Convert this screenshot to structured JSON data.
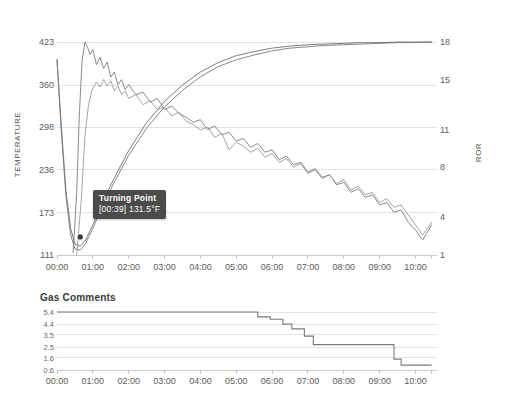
{
  "chart_data": [
    {
      "type": "line",
      "title": "",
      "xlabel": "",
      "ylabel": "TEMPERATURE",
      "y2label": "ROR",
      "grid": true,
      "legend": "none",
      "xlim": [
        0,
        10.6
      ],
      "ylim": [
        111,
        423
      ],
      "y2lim": [
        1,
        18
      ],
      "x_tick_labels": [
        "00:00",
        "01:00",
        "02:00",
        "03:00",
        "04:00",
        "05:00",
        "06:00",
        "07:00",
        "08:00",
        "09:00",
        "10:00"
      ],
      "x_tick_values": [
        0,
        1,
        2,
        3,
        4,
        5,
        6,
        7,
        8,
        9,
        10
      ],
      "y_tick_labels": [
        "423",
        "360",
        "298",
        "236",
        "173",
        "111"
      ],
      "y_tick_values": [
        423,
        360,
        298,
        236,
        173,
        111
      ],
      "y2_tick_labels": [
        "18",
        "15",
        "11",
        "8",
        "4",
        "1"
      ],
      "y2_tick_values": [
        18,
        15,
        11,
        8,
        4,
        1
      ],
      "annotations": [
        {
          "name": "turning-point",
          "title": "Turning Point",
          "value": "[00:39] 131.5°F",
          "time": "00:39",
          "temperature": 131.5,
          "unit": "°F"
        }
      ],
      "series": [
        {
          "name": "bean-temperature-1",
          "axis": "left",
          "color": "#6e6e6e",
          "x": [
            0,
            0.12,
            0.25,
            0.38,
            0.5,
            0.65,
            0.8,
            1.0,
            1.3,
            1.6,
            2.0,
            2.5,
            3.0,
            3.5,
            4.0,
            4.5,
            5.0,
            5.5,
            6.0,
            6.5,
            7.0,
            7.5,
            8.0,
            8.5,
            9.0,
            9.5,
            10.0,
            10.45
          ],
          "y": [
            398,
            300,
            205,
            150,
            127,
            124,
            133,
            155,
            192,
            224,
            264,
            305,
            336,
            360,
            379,
            393,
            403,
            409,
            414,
            417,
            419,
            420,
            421,
            422,
            422,
            423,
            423,
            423
          ]
        },
        {
          "name": "bean-temperature-2",
          "axis": "left",
          "color": "#7a7a7a",
          "x": [
            0,
            0.12,
            0.25,
            0.38,
            0.5,
            0.65,
            0.8,
            1.0,
            1.3,
            1.6,
            2.0,
            2.5,
            3.0,
            3.5,
            4.0,
            4.5,
            5.0,
            5.5,
            6.0,
            6.5,
            7.0,
            7.5,
            8.0,
            8.5,
            9.0,
            9.5,
            10.0,
            10.45
          ],
          "y": [
            396,
            292,
            196,
            141,
            120,
            118,
            128,
            150,
            186,
            218,
            257,
            297,
            328,
            352,
            372,
            387,
            397,
            404,
            410,
            414,
            416,
            418,
            419,
            420,
            421,
            422,
            422,
            423
          ]
        },
        {
          "name": "rate-of-rise-1",
          "axis": "right",
          "color": "#7d7d7d",
          "x": [
            0.45,
            0.55,
            0.62,
            0.7,
            0.78,
            0.85,
            0.92,
            1.0,
            1.1,
            1.2,
            1.3,
            1.4,
            1.5,
            1.6,
            1.7,
            1.8,
            1.9,
            2.0,
            2.2,
            2.4,
            2.6,
            2.8,
            3.0,
            3.2,
            3.4,
            3.6,
            3.8,
            4.0,
            4.2,
            4.4,
            4.6,
            4.8,
            5.0,
            5.2,
            5.4,
            5.6,
            5.8,
            6.0,
            6.2,
            6.4,
            6.6,
            6.8,
            7.0,
            7.2,
            7.4,
            7.6,
            7.8,
            8.0,
            8.2,
            8.4,
            8.6,
            8.8,
            9.0,
            9.2,
            9.4,
            9.6,
            9.8,
            10.0,
            10.2,
            10.45
          ],
          "y": [
            1.2,
            6.0,
            12.0,
            16.5,
            18.0,
            17.6,
            17.0,
            17.4,
            16.2,
            16.8,
            15.9,
            16.4,
            15.2,
            15.6,
            14.6,
            15.0,
            14.2,
            14.6,
            13.8,
            14.0,
            13.2,
            13.5,
            12.6,
            12.9,
            12.3,
            12.0,
            11.6,
            11.8,
            11.0,
            11.3,
            10.6,
            10.8,
            10.1,
            10.3,
            9.6,
            9.9,
            9.2,
            9.4,
            8.6,
            8.9,
            8.2,
            8.4,
            7.6,
            7.9,
            7.2,
            7.4,
            6.6,
            6.8,
            6.0,
            6.3,
            5.6,
            5.8,
            5.0,
            5.2,
            4.4,
            4.6,
            3.6,
            3.0,
            2.2,
            3.4
          ]
        },
        {
          "name": "rate-of-rise-2",
          "axis": "right",
          "color": "#9a9a9a",
          "x": [
            0.55,
            0.68,
            0.78,
            0.88,
            0.98,
            1.1,
            1.2,
            1.3,
            1.4,
            1.5,
            1.6,
            1.7,
            1.8,
            1.9,
            2.0,
            2.2,
            2.4,
            2.6,
            2.8,
            3.0,
            3.2,
            3.4,
            3.6,
            3.8,
            4.0,
            4.2,
            4.4,
            4.6,
            4.8,
            5.0,
            5.2,
            5.4,
            5.6,
            5.8,
            6.0,
            6.2,
            6.4,
            6.6,
            6.8,
            7.0,
            7.2,
            7.4,
            7.6,
            7.8,
            8.0,
            8.2,
            8.4,
            8.6,
            8.8,
            9.0,
            9.2,
            9.4,
            9.6,
            9.8,
            10.0,
            10.2,
            10.45
          ],
          "y": [
            1.0,
            5.5,
            10.5,
            13.0,
            14.2,
            14.8,
            14.4,
            15.0,
            14.5,
            14.9,
            14.1,
            14.5,
            13.8,
            14.1,
            13.5,
            13.8,
            13.0,
            13.3,
            12.6,
            12.8,
            12.1,
            12.4,
            11.7,
            11.4,
            11.0,
            11.2,
            10.4,
            10.7,
            9.4,
            10.0,
            9.7,
            9.2,
            9.5,
            8.8,
            9.1,
            8.4,
            8.7,
            8.0,
            8.3,
            7.5,
            7.8,
            7.1,
            7.4,
            6.7,
            7.0,
            6.2,
            6.5,
            5.8,
            6.0,
            5.2,
            5.5,
            4.8,
            5.0,
            4.2,
            3.4,
            2.6,
            3.6
          ]
        }
      ]
    },
    {
      "type": "line",
      "title": "Gas Comments",
      "xlabel": "",
      "ylabel": "",
      "grid": true,
      "legend": "none",
      "step": true,
      "xlim": [
        0,
        10.6
      ],
      "ylim": [
        0.6,
        5.4
      ],
      "x_tick_labels": [
        "00:00",
        "01:00",
        "02:00",
        "03:00",
        "04:00",
        "05:00",
        "06:00",
        "07:00",
        "08:00",
        "09:00",
        "10:00"
      ],
      "x_tick_values": [
        0,
        1,
        2,
        3,
        4,
        5,
        6,
        7,
        8,
        9,
        10
      ],
      "y_tick_labels": [
        "5.4",
        "4.4",
        "3.5",
        "2.5",
        "1.6",
        "0.6"
      ],
      "y_tick_values": [
        5.4,
        4.4,
        3.5,
        2.5,
        1.6,
        0.6
      ],
      "series": [
        {
          "name": "gas-setting",
          "color": "#7b7b7b",
          "x": [
            0,
            5.35,
            5.6,
            5.95,
            6.3,
            6.55,
            6.9,
            7.15,
            9.15,
            9.4,
            9.6,
            10.45
          ],
          "y": [
            5.4,
            5.4,
            5.0,
            4.8,
            4.4,
            4.0,
            3.4,
            2.7,
            2.7,
            1.5,
            1.0,
            1.0
          ]
        }
      ]
    }
  ]
}
